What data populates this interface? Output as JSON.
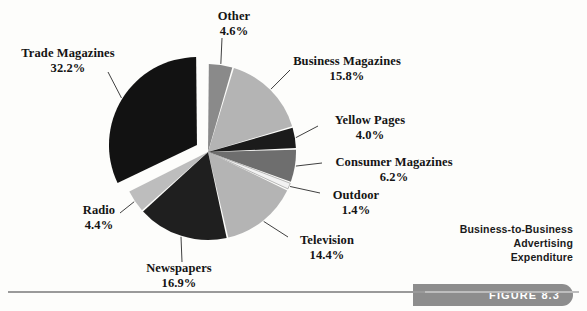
{
  "figure": {
    "caption_lines": [
      "Business-to-Business",
      "Advertising",
      "Expenditure"
    ],
    "figure_label": "FIGURE 8.3",
    "pill_color": "#8d8d8d"
  },
  "chart_data": {
    "type": "pie",
    "title": "Business-to-Business Advertising Expenditure",
    "units": "percent",
    "legend": "none",
    "labels_position": "outside-with-leader-lines",
    "start_angle_deg": 0,
    "direction": "clockwise",
    "categories": [
      "Other",
      "Business Magazines",
      "Yellow Pages",
      "Consumer Magazines",
      "Outdoor",
      "Television",
      "Newspapers",
      "Radio",
      "Trade Magazines"
    ],
    "values": [
      4.6,
      15.8,
      4.0,
      6.2,
      1.4,
      14.4,
      16.9,
      4.4,
      32.2
    ],
    "slices": [
      {
        "label": "Other",
        "value": 4.6,
        "pct_text": "4.6%",
        "color": "#8a8a8a",
        "exploded": false
      },
      {
        "label": "Business Magazines",
        "value": 15.8,
        "pct_text": "15.8%",
        "color": "#b4b4b4",
        "exploded": false
      },
      {
        "label": "Yellow Pages",
        "value": 4.0,
        "pct_text": "4.0%",
        "color": "#1b1b1b",
        "exploded": false
      },
      {
        "label": "Consumer Magazines",
        "value": 6.2,
        "pct_text": "6.2%",
        "color": "#6e6e6e",
        "exploded": false
      },
      {
        "label": "Outdoor",
        "value": 1.4,
        "pct_text": "1.4%",
        "color": "#f2f2f2",
        "exploded": false
      },
      {
        "label": "Television",
        "value": 14.4,
        "pct_text": "14.4%",
        "color": "#b4b4b4",
        "exploded": false
      },
      {
        "label": "Newspapers",
        "value": 16.9,
        "pct_text": "16.9%",
        "color": "#1f1f1f",
        "exploded": false
      },
      {
        "label": "Radio",
        "value": 4.4,
        "pct_text": "4.4%",
        "color": "#bdbdbd",
        "exploded": false
      },
      {
        "label": "Trade Magazines",
        "value": 32.2,
        "pct_text": "32.2%",
        "color": "#121212",
        "exploded": true
      }
    ]
  },
  "labels": {
    "other": {
      "name": "Other",
      "pct": "4.6%"
    },
    "business_magazines": {
      "name": "Business Magazines",
      "pct": "15.8%"
    },
    "yellow_pages": {
      "name": "Yellow Pages",
      "pct": "4.0%"
    },
    "consumer_magazines": {
      "name": "Consumer Magazines",
      "pct": "6.2%"
    },
    "outdoor": {
      "name": "Outdoor",
      "pct": "1.4%"
    },
    "television": {
      "name": "Television",
      "pct": "14.4%"
    },
    "newspapers": {
      "name": "Newspapers",
      "pct": "16.9%"
    },
    "radio": {
      "name": "Radio",
      "pct": "4.4%"
    },
    "trade_magazines": {
      "name": "Trade Magazines",
      "pct": "32.2%"
    }
  }
}
